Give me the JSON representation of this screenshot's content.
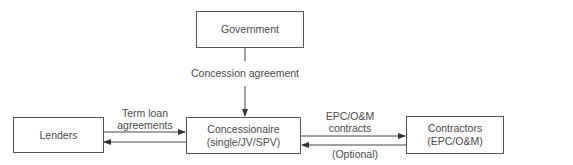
{
  "diagram": {
    "nodes": {
      "government": {
        "label": "Government"
      },
      "lenders": {
        "label": "Lenders"
      },
      "concessionaire": {
        "line1": "Concessionaire",
        "line2": "(single/JV/SPV)"
      },
      "contractors": {
        "line1": "Contractors",
        "line2": "(EPC/O&M)"
      }
    },
    "edges": {
      "concession": {
        "label": "Concession agreement"
      },
      "term_loan": {
        "line1": "Term loan",
        "line2": "agreements"
      },
      "epc": {
        "line1": "EPC/O&M",
        "line2": "contracts"
      },
      "optional": {
        "label": "(Optional)"
      }
    },
    "colors": {
      "stroke": "#444444",
      "text": "#4a4a4a"
    }
  }
}
